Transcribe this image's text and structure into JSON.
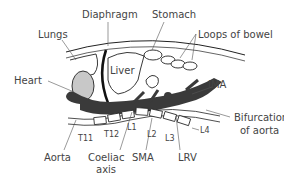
{
  "diagram": {
    "labels": {
      "lungs": "Lungs",
      "diaphragm": "Diaphragm",
      "stomach": "Stomach",
      "loops_of_bowel": "Loops of bowel",
      "heart": "Heart",
      "liver": "Liver",
      "ima": "IMA",
      "bifurcation_line1": "Bifurcation",
      "bifurcation_line2": "of aorta",
      "aorta": "Aorta",
      "coeliac_line1": "Coeliac",
      "coeliac_line2": "axis",
      "sma": "SMA",
      "lrv": "LRV",
      "t11": "T11",
      "t12": "T12",
      "l1": "L1",
      "l2": "L2",
      "l3": "L3",
      "l4": "L4"
    },
    "colors": {
      "aorta_fill": "#3a3a3a",
      "heart_fill": "#c8c8c8",
      "line": "#222222",
      "text": "#444444"
    }
  }
}
